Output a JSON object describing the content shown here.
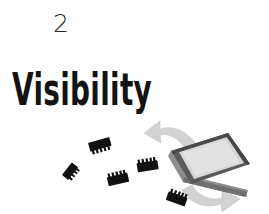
{
  "page": {
    "background_color": "#ffffff",
    "width": 269,
    "height": 214
  },
  "chapter": {
    "number": "2",
    "title": "Visibility",
    "number_color": "#2b2b2b",
    "title_color": "#131313"
  },
  "illustration": {
    "name": "chips-and-tray-illustration",
    "description": "Five black integrated-circuit chips scattered beside an isometric gray tray, with two pale gray curved arrows flowing around the tray",
    "colors": {
      "chip_body": "#111111",
      "tray_frame": "#5a5a5a",
      "tray_frame_dark": "#3f3f3f",
      "tray_side": "#8e8e8e",
      "tray_interior": "#d6d6d6",
      "tray_interior_light": "#e4e4e4",
      "arrow": "#d2d2d2",
      "arrow_edge": "#bdbdbd"
    },
    "chips": [
      {
        "name": "chip-upper-left",
        "label": "ic-chip"
      },
      {
        "name": "chip-left",
        "label": "ic-chip"
      },
      {
        "name": "chip-lower-middle",
        "label": "ic-chip"
      },
      {
        "name": "chip-middle",
        "label": "ic-chip"
      },
      {
        "name": "chip-lower-right",
        "label": "ic-chip"
      }
    ],
    "arrows": [
      {
        "name": "arrow-up-left",
        "direction": "up-left"
      },
      {
        "name": "arrow-down-right",
        "direction": "down-right"
      }
    ],
    "tray": {
      "name": "component-tray",
      "label": "tray"
    }
  }
}
